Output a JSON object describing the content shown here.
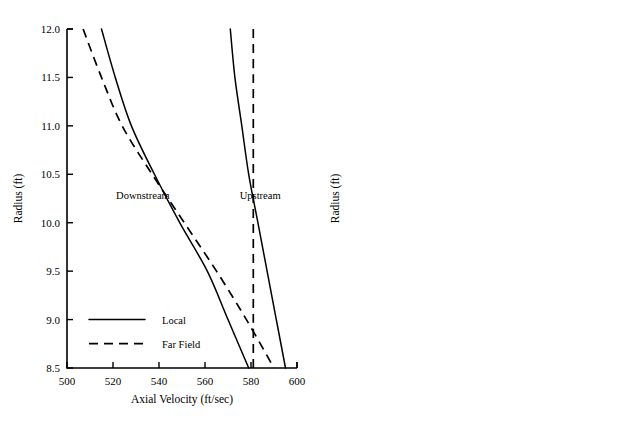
{
  "chart_data": [
    {
      "id": "left",
      "type": "line",
      "title": "",
      "xlabel": "Axial Velocity (ft/sec)",
      "ylabel": "Radius (ft)",
      "xlim": [
        500,
        600
      ],
      "ylim": [
        8.5,
        12.0
      ],
      "xticks": [
        500,
        520,
        540,
        560,
        580,
        600
      ],
      "xticklabels": [
        "500",
        "520",
        "540",
        "560",
        "580",
        "600"
      ],
      "yticks": [
        8.5,
        9.0,
        9.5,
        10.0,
        10.5,
        11.0,
        11.5,
        12.0
      ],
      "yticklabels": [
        "8.5",
        "9.0",
        "9.5",
        "10.0",
        "10.5",
        "11.0",
        "11.5",
        "12.0"
      ],
      "grid": false,
      "legend_position": "lower-left",
      "legend": [
        {
          "label": "Local",
          "style": "solid"
        },
        {
          "label": "Far Field",
          "style": "dashed"
        }
      ],
      "annotations": [
        {
          "text": "Downstream",
          "x": 533,
          "y": 10.25
        },
        {
          "text": "Upstream",
          "x": 584,
          "y": 10.25
        }
      ],
      "series": [
        {
          "name": "Downstream Local",
          "style": "solid",
          "points": [
            [
              515,
              12.0
            ],
            [
              521,
              11.5
            ],
            [
              528,
              11.0
            ],
            [
              538,
              10.5
            ],
            [
              549,
              10.0
            ],
            [
              561,
              9.5
            ],
            [
              570,
              9.0
            ],
            [
              579,
              8.5
            ]
          ]
        },
        {
          "name": "Downstream Far Field",
          "style": "dashed",
          "points": [
            [
              507,
              12.0
            ],
            [
              515,
              11.5
            ],
            [
              524,
              11.0
            ],
            [
              537,
              10.5
            ],
            [
              551,
              10.0
            ],
            [
              565,
              9.5
            ],
            [
              578,
              9.0
            ],
            [
              590,
              8.5
            ]
          ]
        },
        {
          "name": "Upstream Local",
          "style": "solid",
          "points": [
            [
              571,
              12.0
            ],
            [
              573,
              11.5
            ],
            [
              576,
              11.0
            ],
            [
              579,
              10.5
            ],
            [
              583,
              10.0
            ],
            [
              587,
              9.5
            ],
            [
              591,
              9.0
            ],
            [
              595,
              8.5
            ]
          ]
        },
        {
          "name": "Upstream Far Field",
          "style": "dashed",
          "points": [
            [
              581,
              12.0
            ],
            [
              581,
              11.5
            ],
            [
              581,
              11.0
            ],
            [
              581,
              10.5
            ],
            [
              581,
              10.0
            ],
            [
              581,
              9.5
            ],
            [
              581,
              9.0
            ],
            [
              581,
              8.5
            ]
          ]
        }
      ]
    },
    {
      "id": "right",
      "type": "line",
      "title": "",
      "xlabel": "Axial Velocity (ft/sec)",
      "ylabel": "Radius (ft)",
      "xlim": [
        500,
        600
      ],
      "ylim": [
        8.5,
        12.0
      ],
      "xticks": [
        500,
        520,
        540,
        560,
        580,
        600
      ],
      "xticklabels": [
        "500",
        "520",
        "540",
        "560",
        "580",
        "600"
      ],
      "yticks": [
        8.5,
        9.0,
        9.5,
        10.0,
        10.5,
        11.0,
        11.5,
        12.0
      ],
      "yticklabels": [
        "8.5",
        "9.0",
        "9.5",
        "10.0",
        "10.5",
        "11.0",
        "11.5",
        "12.0"
      ],
      "grid": false,
      "legend_position": "lower-left",
      "legend": [
        {
          "label": "Analytical",
          "style": "solid"
        },
        {
          "label": "Streamline Curvature",
          "style": "marker"
        }
      ],
      "annotations": [
        {
          "text": "T.E.",
          "x": 534,
          "y": 10.25
        },
        {
          "text": "L.E.",
          "x": 584,
          "y": 10.25
        }
      ],
      "series": [
        {
          "name": "T.E. Analytical",
          "style": "solid",
          "points": [
            [
              516,
              12.0
            ],
            [
              523,
              11.5
            ],
            [
              532,
              11.0
            ],
            [
              543,
              10.5
            ],
            [
              553,
              10.0
            ],
            [
              562,
              9.5
            ],
            [
              571,
              9.0
            ],
            [
              581,
              8.5
            ]
          ]
        },
        {
          "name": "T.E. Streamline Curvature",
          "style": "marker",
          "points": [
            [
              516,
              12.0
            ],
            [
              524,
              11.5
            ],
            [
              532,
              11.0
            ],
            [
              545,
              10.5
            ],
            [
              552,
              10.0
            ],
            [
              561,
              9.5
            ],
            [
              571,
              9.0
            ],
            [
              581,
              8.5
            ]
          ]
        },
        {
          "name": "L.E. Analytical",
          "style": "solid",
          "points": [
            [
              572,
              12.0
            ],
            [
              574,
              11.5
            ],
            [
              578,
              11.0
            ],
            [
              583,
              10.5
            ],
            [
              587,
              10.0
            ],
            [
              590,
              9.5
            ],
            [
              593,
              9.0
            ],
            [
              595,
              8.5
            ]
          ]
        },
        {
          "name": "L.E. Streamline Curvature",
          "style": "marker",
          "points": [
            [
              572,
              12.0
            ],
            [
              574,
              11.5
            ],
            [
              578,
              11.0
            ],
            [
              583,
              10.5
            ],
            [
              587,
              10.0
            ],
            [
              590,
              9.5
            ],
            [
              593,
              9.0
            ],
            [
              595,
              8.5
            ]
          ]
        }
      ]
    }
  ]
}
